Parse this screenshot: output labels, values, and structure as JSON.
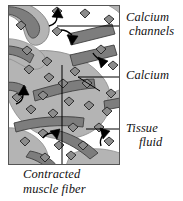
{
  "figure": {
    "type": "biological-diagram",
    "panel": {
      "border_color": "#555555",
      "fluid_color": "#ffffff",
      "fiber_color": "#b4b4b4",
      "fiber_dark_color": "#8a8a8a",
      "band_color": "#7d7d7d",
      "band_border_color": "#3f3f3f",
      "calcium_fill": "#8c8c8c",
      "calcium_stroke": "#222222",
      "arrow_color": "#000000",
      "leader_color": "#000000"
    }
  },
  "labels": {
    "calcium_channels": {
      "line1": "Calcium",
      "line2": "channels"
    },
    "calcium": {
      "line1": "Calcium"
    },
    "tissue_fluid": {
      "line1": "Tissue",
      "line2": "fluid"
    },
    "contracted_muscle_fiber": {
      "line1": "Contracted",
      "line2": "muscle fiber"
    }
  }
}
